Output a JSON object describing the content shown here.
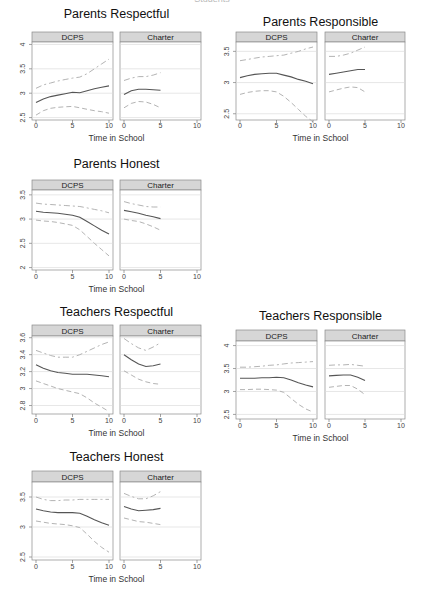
{
  "page": {
    "top_cut_text": "Students"
  },
  "panel_labels": [
    "DCPS",
    "Charter"
  ],
  "x_axis_label": "Time in School",
  "x_ticks": [
    0,
    5,
    10
  ],
  "colors": {
    "strip_fill": "#d6d6d6",
    "strip_border": "#8a8a8a",
    "panel_border": "#8a8a8a",
    "grid": "#dcdcdc",
    "mean_line": "#555555",
    "ci_line": "#aaaaaa"
  },
  "chart_data": [
    {
      "id": "parents-respectful",
      "type": "line",
      "title": "Parents Respectful",
      "xlabel": "Time in School",
      "ylabel": "",
      "ylim": [
        2.45,
        4.05
      ],
      "yticks": [
        2.5,
        3,
        3.5,
        4
      ],
      "ytick_labels": [
        "2.5",
        "3",
        "3.5",
        "4"
      ],
      "xlim": [
        0,
        10
      ],
      "layout": {
        "x": [
          32,
          113,
          120,
          201
        ],
        "strip_top": 32,
        "plot_top": 42,
        "plot_bottom": 120,
        "title_y": 18,
        "tick_y": 128,
        "xlabel_y": 141,
        "ylab_x": 22
      },
      "panels": [
        {
          "label": "DCPS",
          "x": [
            0,
            1,
            2,
            3,
            4,
            5,
            6,
            7,
            8,
            9,
            10
          ],
          "series": [
            {
              "name": "mean",
              "values": [
                2.81,
                2.88,
                2.93,
                2.96,
                2.99,
                3.02,
                3.01,
                3.05,
                3.09,
                3.12,
                3.15
              ]
            },
            {
              "name": "upper_ci",
              "values": [
                3.1,
                3.17,
                3.21,
                3.25,
                3.28,
                3.31,
                3.33,
                3.4,
                3.5,
                3.6,
                3.7
              ]
            },
            {
              "name": "lower_ci",
              "values": [
                2.55,
                2.64,
                2.69,
                2.71,
                2.72,
                2.73,
                2.7,
                2.67,
                2.64,
                2.62,
                2.59
              ]
            }
          ]
        },
        {
          "label": "Charter",
          "x": [
            0,
            1,
            2,
            3,
            4,
            5
          ],
          "series": [
            {
              "name": "mean",
              "values": [
                2.97,
                3.05,
                3.08,
                3.08,
                3.07,
                3.06
              ]
            },
            {
              "name": "upper_ci",
              "values": [
                3.26,
                3.31,
                3.34,
                3.34,
                3.37,
                3.42
              ]
            },
            {
              "name": "lower_ci",
              "values": [
                2.7,
                2.79,
                2.83,
                2.82,
                2.77,
                2.7
              ]
            }
          ]
        }
      ]
    },
    {
      "id": "parents-responsible",
      "type": "line",
      "title": "Parents Responsible",
      "xlabel": "Time in School",
      "ylabel": "",
      "ylim": [
        2.4,
        3.65
      ],
      "yticks": [
        2.5,
        3,
        3.5
      ],
      "ytick_labels": [
        "2.5",
        "3",
        "3.5"
      ],
      "xlim": [
        0,
        10
      ],
      "layout": {
        "x": [
          236,
          317,
          325,
          405
        ],
        "strip_top": 32,
        "plot_top": 42,
        "plot_bottom": 120,
        "title_y": 26,
        "tick_y": 128,
        "xlabel_y": 141,
        "ylab_x": 226
      },
      "panels": [
        {
          "label": "DCPS",
          "x": [
            0,
            1,
            2,
            3,
            4,
            5,
            6,
            7,
            8,
            9,
            10
          ],
          "series": [
            {
              "name": "mean",
              "values": [
                3.08,
                3.11,
                3.13,
                3.14,
                3.15,
                3.15,
                3.12,
                3.09,
                3.05,
                3.02,
                2.98
              ]
            },
            {
              "name": "upper_ci",
              "values": [
                3.35,
                3.37,
                3.39,
                3.41,
                3.42,
                3.43,
                3.44,
                3.47,
                3.5,
                3.54,
                3.57
              ]
            },
            {
              "name": "lower_ci",
              "values": [
                2.81,
                2.84,
                2.86,
                2.87,
                2.87,
                2.85,
                2.78,
                2.68,
                2.57,
                2.46,
                2.37
              ]
            }
          ]
        },
        {
          "label": "Charter",
          "x": [
            0,
            1,
            2,
            3,
            4,
            5
          ],
          "series": [
            {
              "name": "mean",
              "values": [
                3.13,
                3.15,
                3.17,
                3.19,
                3.21,
                3.21
              ]
            },
            {
              "name": "upper_ci",
              "values": [
                3.42,
                3.42,
                3.44,
                3.47,
                3.52,
                3.57
              ]
            },
            {
              "name": "lower_ci",
              "values": [
                2.85,
                2.88,
                2.91,
                2.93,
                2.92,
                2.85
              ]
            }
          ]
        }
      ]
    },
    {
      "id": "parents-honest",
      "type": "line",
      "title": "Parents Honest",
      "xlabel": "Time in School",
      "ylabel": "",
      "ylim": [
        1.95,
        3.6
      ],
      "yticks": [
        2,
        2.5,
        3,
        3.5
      ],
      "ytick_labels": [
        "2",
        "2.5",
        "3",
        "3.5"
      ],
      "xlim": [
        0,
        10
      ],
      "layout": {
        "x": [
          32,
          113,
          120,
          201
        ],
        "strip_top": 180,
        "plot_top": 190,
        "plot_bottom": 270,
        "title_y": 168,
        "tick_y": 279,
        "xlabel_y": 292,
        "ylab_x": 22
      },
      "panels": [
        {
          "label": "DCPS",
          "x": [
            0,
            1,
            2,
            3,
            4,
            5,
            6,
            7,
            8,
            9,
            10
          ],
          "series": [
            {
              "name": "mean",
              "values": [
                3.16,
                3.14,
                3.13,
                3.12,
                3.1,
                3.08,
                3.04,
                2.95,
                2.86,
                2.77,
                2.69
              ]
            },
            {
              "name": "upper_ci",
              "values": [
                3.33,
                3.31,
                3.3,
                3.29,
                3.28,
                3.27,
                3.26,
                3.23,
                3.2,
                3.17,
                3.13
              ]
            },
            {
              "name": "lower_ci",
              "values": [
                2.98,
                2.96,
                2.95,
                2.93,
                2.9,
                2.87,
                2.78,
                2.64,
                2.5,
                2.37,
                2.24
              ]
            }
          ]
        },
        {
          "label": "Charter",
          "x": [
            0,
            1,
            2,
            3,
            4,
            5
          ],
          "series": [
            {
              "name": "mean",
              "values": [
                3.18,
                3.15,
                3.12,
                3.08,
                3.05,
                3.01
              ]
            },
            {
              "name": "upper_ci",
              "values": [
                3.36,
                3.32,
                3.29,
                3.26,
                3.25,
                3.25
              ]
            },
            {
              "name": "lower_ci",
              "values": [
                3.0,
                2.97,
                2.95,
                2.9,
                2.84,
                2.77
              ]
            }
          ]
        }
      ]
    },
    {
      "id": "teachers-respectful",
      "type": "line",
      "title": "Teachers Respectful",
      "xlabel": "Time in School",
      "ylabel": "",
      "ylim": [
        2.7,
        3.62
      ],
      "yticks": [
        2.8,
        3,
        3.2,
        3.4,
        3.6
      ],
      "ytick_labels": [
        "2.8",
        "3",
        "3.2",
        "3.4",
        "3.6"
      ],
      "xlim": [
        0,
        10
      ],
      "layout": {
        "x": [
          32,
          113,
          120,
          201
        ],
        "strip_top": 325,
        "plot_top": 336,
        "plot_bottom": 414,
        "title_y": 316,
        "tick_y": 423,
        "xlabel_y": 436,
        "ylab_x": 22
      },
      "panels": [
        {
          "label": "DCPS",
          "x": [
            0,
            1,
            2,
            3,
            4,
            5,
            6,
            7,
            8,
            9,
            10
          ],
          "series": [
            {
              "name": "mean",
              "values": [
                3.28,
                3.24,
                3.21,
                3.19,
                3.18,
                3.17,
                3.17,
                3.17,
                3.16,
                3.15,
                3.14
              ]
            },
            {
              "name": "upper_ci",
              "values": [
                3.45,
                3.42,
                3.39,
                3.37,
                3.37,
                3.37,
                3.4,
                3.44,
                3.48,
                3.52,
                3.55
              ]
            },
            {
              "name": "lower_ci",
              "values": [
                3.09,
                3.06,
                3.03,
                3.0,
                2.98,
                2.96,
                2.94,
                2.89,
                2.83,
                2.78,
                2.73
              ]
            }
          ]
        },
        {
          "label": "Charter",
          "x": [
            0,
            1,
            2,
            3,
            4,
            5
          ],
          "series": [
            {
              "name": "mean",
              "values": [
                3.4,
                3.34,
                3.29,
                3.26,
                3.27,
                3.29
              ]
            },
            {
              "name": "upper_ci",
              "values": [
                3.59,
                3.53,
                3.48,
                3.45,
                3.49,
                3.54
              ]
            },
            {
              "name": "lower_ci",
              "values": [
                3.21,
                3.16,
                3.11,
                3.08,
                3.06,
                3.05
              ]
            }
          ]
        }
      ]
    },
    {
      "id": "teachers-responsible",
      "type": "line",
      "title": "Teachers Responsible",
      "xlabel": "Time in School",
      "ylabel": "",
      "ylim": [
        2.4,
        4.1
      ],
      "yticks": [
        2.5,
        3,
        3.5,
        4
      ],
      "ytick_labels": [
        "2.5",
        "3",
        "3.5",
        "4"
      ],
      "xlim": [
        0,
        10
      ],
      "layout": {
        "x": [
          236,
          317,
          325,
          405
        ],
        "strip_top": 330,
        "plot_top": 341,
        "plot_bottom": 419,
        "title_y": 320,
        "tick_y": 428,
        "xlabel_y": 441,
        "ylab_x": 226
      },
      "panels": [
        {
          "label": "DCPS",
          "x": [
            0,
            1,
            2,
            3,
            4,
            5,
            6,
            7,
            8,
            9,
            10
          ],
          "series": [
            {
              "name": "mean",
              "values": [
                3.29,
                3.29,
                3.29,
                3.3,
                3.3,
                3.31,
                3.3,
                3.25,
                3.19,
                3.14,
                3.1
              ]
            },
            {
              "name": "upper_ci",
              "values": [
                3.53,
                3.53,
                3.54,
                3.55,
                3.57,
                3.58,
                3.6,
                3.62,
                3.63,
                3.64,
                3.65
              ]
            },
            {
              "name": "lower_ci",
              "values": [
                3.04,
                3.04,
                3.05,
                3.05,
                3.04,
                3.03,
                2.98,
                2.85,
                2.72,
                2.62,
                2.55
              ]
            }
          ]
        },
        {
          "label": "Charter",
          "x": [
            0,
            1,
            2,
            3,
            4,
            5
          ],
          "series": [
            {
              "name": "mean",
              "values": [
                3.34,
                3.35,
                3.36,
                3.36,
                3.31,
                3.24
              ]
            },
            {
              "name": "upper_ci",
              "values": [
                3.57,
                3.58,
                3.58,
                3.59,
                3.57,
                3.55
              ]
            },
            {
              "name": "lower_ci",
              "values": [
                3.09,
                3.11,
                3.13,
                3.13,
                3.05,
                2.93
              ]
            }
          ]
        }
      ]
    },
    {
      "id": "teachers-honest",
      "type": "line",
      "title": "Teachers Honest",
      "xlabel": "Time in School",
      "ylabel": "",
      "ylim": [
        2.45,
        3.75
      ],
      "yticks": [
        2.5,
        3,
        3.5
      ],
      "ytick_labels": [
        "2.5",
        "3",
        "3.5"
      ],
      "xlim": [
        0,
        10
      ],
      "layout": {
        "x": [
          32,
          113,
          120,
          201
        ],
        "strip_top": 471,
        "plot_top": 482,
        "plot_bottom": 560,
        "title_y": 461,
        "tick_y": 569,
        "xlabel_y": 582,
        "ylab_x": 22
      },
      "panels": [
        {
          "label": "DCPS",
          "x": [
            0,
            1,
            2,
            3,
            4,
            5,
            6,
            7,
            8,
            9,
            10
          ],
          "series": [
            {
              "name": "mean",
              "values": [
                3.3,
                3.27,
                3.25,
                3.24,
                3.24,
                3.24,
                3.23,
                3.18,
                3.12,
                3.07,
                3.03
              ]
            },
            {
              "name": "upper_ci",
              "values": [
                3.5,
                3.46,
                3.44,
                3.44,
                3.45,
                3.45,
                3.46,
                3.46,
                3.46,
                3.46,
                3.46
              ]
            },
            {
              "name": "lower_ci",
              "values": [
                3.1,
                3.08,
                3.06,
                3.05,
                3.04,
                3.02,
                2.99,
                2.88,
                2.76,
                2.66,
                2.58
              ]
            }
          ]
        },
        {
          "label": "Charter",
          "x": [
            0,
            1,
            2,
            3,
            4,
            5
          ],
          "series": [
            {
              "name": "mean",
              "values": [
                3.34,
                3.3,
                3.27,
                3.28,
                3.29,
                3.31
              ]
            },
            {
              "name": "upper_ci",
              "values": [
                3.56,
                3.51,
                3.47,
                3.47,
                3.52,
                3.59
              ]
            },
            {
              "name": "lower_ci",
              "values": [
                3.15,
                3.12,
                3.09,
                3.08,
                3.06,
                3.04
              ]
            }
          ]
        }
      ]
    }
  ]
}
